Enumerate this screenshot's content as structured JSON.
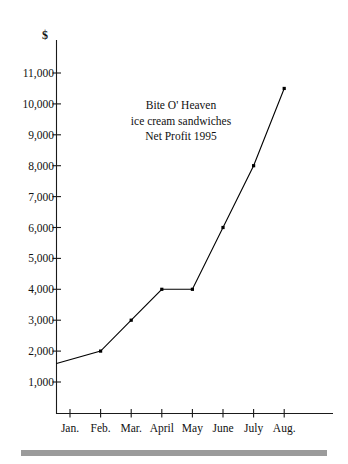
{
  "chart_data": {
    "type": "line",
    "title": "Bite O' Heaven ice cream sandwiches Net Profit 1995",
    "title_lines": [
      "Bite O' Heaven",
      "ice cream sandwiches",
      "Net Profit 1995"
    ],
    "xlabel": "",
    "ylabel": "$",
    "categories": [
      "Jan.",
      "Feb.",
      "Mar.",
      "April",
      "May",
      "June",
      "July",
      "Aug."
    ],
    "values": [
      1600,
      2000,
      3000,
      4000,
      4000,
      6000,
      8000,
      10500
    ],
    "ylim": [
      0,
      11600
    ],
    "xlim": [
      0,
      9
    ],
    "ytick_values": [
      1000,
      2000,
      3000,
      4000,
      5000,
      6000,
      7000,
      8000,
      9000,
      10000,
      11000
    ],
    "ytick_labels": [
      "1,000",
      "2,000",
      "3,000",
      "4,000",
      "5,000",
      "6,000",
      "7,000",
      "8,000",
      "9,000",
      "10,000",
      "11,000"
    ],
    "xtick_labels": [
      "Jan.",
      "Feb.",
      "Mar.",
      "April",
      "May",
      "June",
      "July",
      "Aug."
    ],
    "grid": false,
    "legend": false,
    "legend_position": "none",
    "series": [
      {
        "name": "Net Profit 1995",
        "values": [
          1600,
          2000,
          3000,
          4000,
          4000,
          6000,
          8000,
          10500
        ],
        "marker": "square",
        "color": "#000000"
      }
    ],
    "annotations": []
  },
  "axis": {
    "currency_symbol": "$"
  },
  "decor": {
    "bottom_rule_color": "#9b9b9b"
  }
}
